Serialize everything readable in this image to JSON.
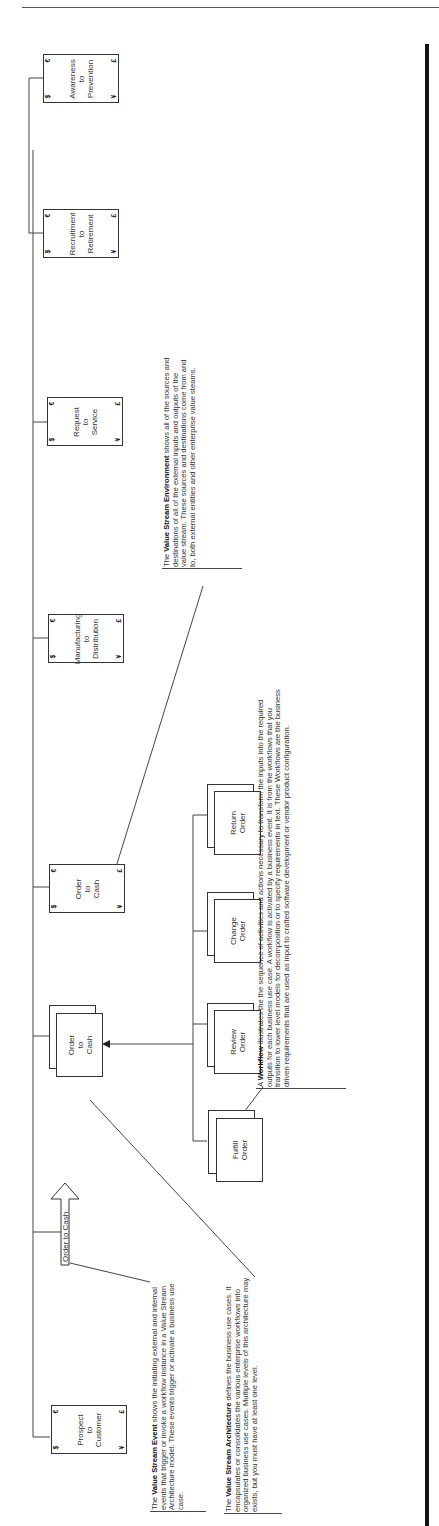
{
  "diagram": {
    "orientation": "rotated -90deg (text reads bottom-to-top)",
    "value_streams": [
      {
        "id": "prospect",
        "label_lines": [
          "Prospect",
          "to",
          "Customer"
        ]
      },
      {
        "id": "order",
        "label_lines": [
          "Order",
          "to",
          "Cash"
        ]
      },
      {
        "id": "manufacturing",
        "label_lines": [
          "Manufacturing",
          "to",
          "Distribution"
        ]
      },
      {
        "id": "request",
        "label_lines": [
          "Request",
          "to",
          "Service"
        ]
      },
      {
        "id": "recruitment",
        "label_lines": [
          "Recruitment",
          "to",
          "Retirement"
        ]
      },
      {
        "id": "awareness",
        "label_lines": [
          "Awareness",
          "to",
          "Prevention"
        ]
      }
    ],
    "currency_corners": {
      "top_left": "€",
      "bottom_left": "$",
      "top_right": "£",
      "bottom_right": "¥"
    },
    "event_arrow": {
      "label": "Order to Cash"
    },
    "business_use_case": {
      "label_lines": [
        "Order",
        "to",
        "Cash"
      ]
    },
    "workflows": [
      {
        "label_lines": [
          "Fulfill",
          "Order"
        ]
      },
      {
        "label_lines": [
          "Review",
          "Order"
        ]
      },
      {
        "label_lines": [
          "Change",
          "Order"
        ]
      },
      {
        "label_lines": [
          "Return",
          "Order"
        ]
      }
    ],
    "notes": {
      "event": {
        "bold": "Value Stream Event",
        "prefix": "The ",
        "text": " shows  the initiating external and internal events that trigger or invoke a workflow instance in a Value Stream Architecture model.  These events trigger or activate a business use case."
      },
      "architecture": {
        "bold": "Value Stream Architecture",
        "prefix": "The ",
        "text": " defines the business use cases.  It encapsulates or consolidates the various enterprise workflows into organized business use cases.  Multiple levels of this architecture may exists, but you must  have at least one level."
      },
      "workflow": {
        "bold": "Workflow",
        "prefix": "A ",
        "text": " illustrates the the sequence of activities and actions necessary  to transform the inputs into the required outputs for each business use case.  A workflow is activated by a business event.  It is from the workflows that you transition to lower level models for decomposition or to specify requirements in text. These Workflows are the business driven requirements that are used as input to crafted software development or vendor product configuration."
      },
      "environment": {
        "bold": "Value Stream Environment",
        "prefix": "The ",
        "text": " shows all of the sources and destinations of all of the external inputs and outputs of the value stream.  These sources and destinations come from and to, both external entities and other enterprise value steams."
      }
    }
  }
}
